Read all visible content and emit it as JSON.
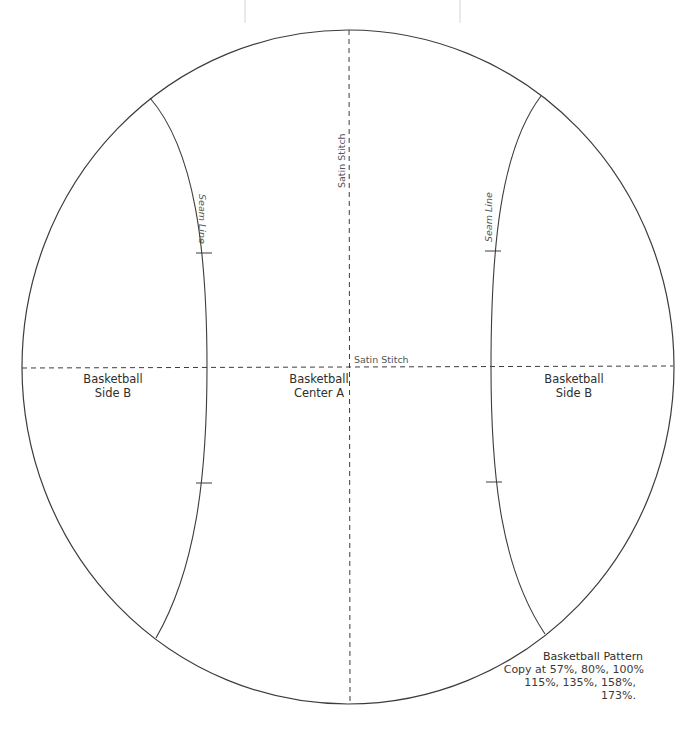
{
  "pattern": {
    "title": "Basketball Pattern",
    "copy_line_1": "Copy at 57%, 80%, 100%",
    "copy_line_2": "115%, 135%, 158%, 173%.",
    "copy_scales": [
      "57%",
      "80%",
      "100%",
      "115%",
      "135%",
      "158%",
      "173%"
    ]
  },
  "pieces": {
    "left": {
      "line1": "Basketball",
      "line2": "Side B"
    },
    "center": {
      "line1": "Basketball",
      "line2": "Center A"
    },
    "right": {
      "line1": "Basketball",
      "line2": "Side B"
    }
  },
  "annotations": {
    "vertical_stitch": "Satin Stitch",
    "horizontal_stitch": "Satin Stitch",
    "left_seam": "Seam Line",
    "right_seam": "Seam Line"
  },
  "colors": {
    "outline": "#3c3c3c",
    "dashed": "#3c3c3c",
    "guide": "#d0d0d0",
    "background": "#ffffff"
  }
}
